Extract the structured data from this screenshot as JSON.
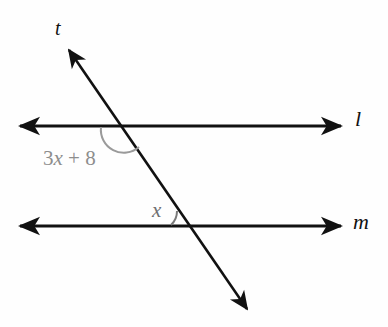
{
  "figure": {
    "type": "geometry-diagram",
    "background_color": "#fefefe",
    "stroke_color": "#111111",
    "arc_color": "#8d8d8d"
  },
  "lines": {
    "top": {
      "name": "l",
      "label": "l",
      "y": 126,
      "x_start": 18,
      "x_end": 343,
      "arrow_left": true,
      "arrow_right": true
    },
    "bottom": {
      "name": "m",
      "label": "m",
      "y": 226,
      "x_start": 18,
      "x_end": 343,
      "arrow_left": true,
      "arrow_right": true
    },
    "transversal": {
      "name": "t",
      "label": "t",
      "x_top": 66,
      "y_top": 46,
      "x_bottom": 250,
      "y_bottom": 313,
      "arrow_top": true,
      "arrow_bottom": true
    }
  },
  "intersections": {
    "with_top_line": {
      "x": 124,
      "y": 126
    },
    "with_bottom_line": {
      "x": 190,
      "y": 226
    }
  },
  "angles": [
    {
      "id": "angle-top",
      "expression": "3x + 8",
      "coefficient": "3",
      "variable": "x",
      "operator": "+",
      "constant": "8",
      "at_intersection": "with_top_line",
      "position": "below-left",
      "arc_radius": 22,
      "label_x": 43,
      "label_y": 148,
      "color": "#8d8d8d"
    },
    {
      "id": "angle-bottom",
      "expression": "x",
      "variable": "x",
      "at_intersection": "with_bottom_line",
      "position": "above-left",
      "arc_radius": 18,
      "label_x": 152,
      "label_y": 200,
      "color": "#6f6f6f"
    }
  ]
}
